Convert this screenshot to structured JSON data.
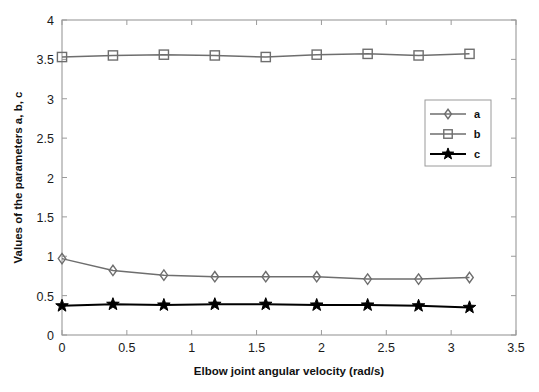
{
  "chart_data": {
    "type": "line",
    "title": "",
    "subtitle": "",
    "xlabel": "Elbow joint angular velocity (rad/s)",
    "ylabel": "Values of the parameters a, b, c",
    "xlim": [
      0,
      3.5
    ],
    "ylim": [
      0,
      4
    ],
    "xticks": [
      "0",
      "0.5",
      "1",
      "1.5",
      "2",
      "2.5",
      "3",
      "3.5"
    ],
    "xtick_values": [
      0,
      0.5,
      1,
      1.5,
      2,
      2.5,
      3,
      3.5
    ],
    "yticks": [
      "0",
      "0.5",
      "1",
      "1.5",
      "2",
      "2.5",
      "3",
      "3.5",
      "4"
    ],
    "ytick_values": [
      0,
      0.5,
      1,
      1.5,
      2,
      2.5,
      3,
      3.5,
      4
    ],
    "grid": false,
    "legend_position": "right-upper",
    "x": [
      0,
      0.3927,
      0.7854,
      1.1781,
      1.5708,
      1.9635,
      2.3562,
      2.7489,
      3.1416
    ],
    "series": [
      {
        "name": "a",
        "marker": "diamond",
        "color": "#6e6e6e",
        "values": [
          0.97,
          0.82,
          0.76,
          0.74,
          0.74,
          0.74,
          0.71,
          0.71,
          0.73
        ]
      },
      {
        "name": "b",
        "marker": "square",
        "color": "#6e6e6e",
        "values": [
          3.53,
          3.55,
          3.56,
          3.55,
          3.53,
          3.56,
          3.57,
          3.55,
          3.57
        ]
      },
      {
        "name": "c",
        "marker": "star",
        "color": "#000000",
        "values": [
          0.37,
          0.39,
          0.38,
          0.39,
          0.39,
          0.38,
          0.38,
          0.37,
          0.35
        ]
      }
    ]
  },
  "legend": {
    "entries": [
      {
        "label": "a"
      },
      {
        "label": "b"
      },
      {
        "label": "c"
      }
    ]
  },
  "colors": {
    "axis": "#9a9a9a",
    "series_gray": "#6e6e6e",
    "series_black": "#000000",
    "text": "#111111",
    "background": "#ffffff"
  }
}
